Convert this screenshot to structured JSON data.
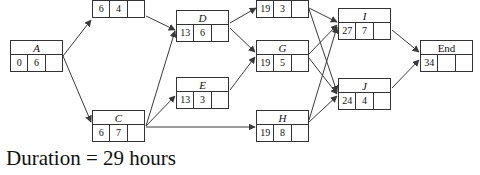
{
  "diagram": {
    "type": "activity-on-node-network",
    "caption": "Duration = 29 hours",
    "edge_color": "#3a3a3a",
    "node_border_color": "#333333",
    "background": "#ffffff",
    "nodes": [
      {
        "id": "A",
        "label": "A",
        "cells": [
          "0",
          "6",
          ""
        ],
        "x": 10,
        "y": 40,
        "w": 53,
        "h": 32,
        "clipped": false
      },
      {
        "id": "B",
        "label": "",
        "cells": [
          "6",
          "4",
          ""
        ],
        "x": 92,
        "y": -14,
        "w": 53,
        "h": 32,
        "clipped": true
      },
      {
        "id": "C",
        "label": "C",
        "cells": [
          "6",
          "7",
          ""
        ],
        "x": 92,
        "y": 110,
        "w": 53,
        "h": 32,
        "clipped": false
      },
      {
        "id": "D",
        "label": "D",
        "cells": [
          "13",
          "6",
          ""
        ],
        "x": 176,
        "y": 10,
        "w": 53,
        "h": 32,
        "clipped": false
      },
      {
        "id": "E",
        "label": "E",
        "cells": [
          "13",
          "3",
          ""
        ],
        "x": 176,
        "y": 77,
        "w": 53,
        "h": 32,
        "clipped": false
      },
      {
        "id": "F",
        "label": "",
        "cells": [
          "19",
          "3",
          ""
        ],
        "x": 256,
        "y": -14,
        "w": 53,
        "h": 32,
        "clipped": true
      },
      {
        "id": "G",
        "label": "G",
        "cells": [
          "19",
          "5",
          ""
        ],
        "x": 256,
        "y": 40,
        "w": 53,
        "h": 32,
        "clipped": false
      },
      {
        "id": "H",
        "label": "H",
        "cells": [
          "19",
          "8",
          ""
        ],
        "x": 256,
        "y": 110,
        "w": 53,
        "h": 32,
        "clipped": false
      },
      {
        "id": "I",
        "label": "I",
        "cells": [
          "27",
          "7",
          ""
        ],
        "x": 338,
        "y": 8,
        "w": 53,
        "h": 32,
        "clipped": false
      },
      {
        "id": "J",
        "label": "J",
        "cells": [
          "24",
          "4",
          ""
        ],
        "x": 338,
        "y": 78,
        "w": 53,
        "h": 32,
        "clipped": false
      },
      {
        "id": "End",
        "label": "End",
        "cells": [
          "34",
          "",
          ""
        ],
        "x": 420,
        "y": 40,
        "w": 53,
        "h": 32,
        "clipped": false,
        "plain": true
      }
    ],
    "edges": [
      {
        "from": "A",
        "to": "B",
        "x1": 63,
        "y1": 56,
        "x2": 91,
        "y2": 20
      },
      {
        "from": "A",
        "to": "C",
        "x1": 63,
        "y1": 56,
        "x2": 91,
        "y2": 122
      },
      {
        "from": "B",
        "to": "D",
        "x1": 146,
        "y1": 16,
        "x2": 175,
        "y2": 30
      },
      {
        "from": "C",
        "to": "D",
        "x1": 146,
        "y1": 126,
        "x2": 175,
        "y2": 31
      },
      {
        "from": "C",
        "to": "E",
        "x1": 146,
        "y1": 126,
        "x2": 175,
        "y2": 96
      },
      {
        "from": "C",
        "to": "H",
        "x1": 146,
        "y1": 127,
        "x2": 255,
        "y2": 127
      },
      {
        "from": "D",
        "to": "F",
        "x1": 230,
        "y1": 23,
        "x2": 256,
        "y2": 8
      },
      {
        "from": "D",
        "to": "G",
        "x1": 230,
        "y1": 28,
        "x2": 255,
        "y2": 52
      },
      {
        "from": "E",
        "to": "G",
        "x1": 230,
        "y1": 90,
        "x2": 255,
        "y2": 57
      },
      {
        "from": "F",
        "to": "I",
        "x1": 309,
        "y1": 8,
        "x2": 337,
        "y2": 22
      },
      {
        "from": "F",
        "to": "J",
        "x1": 309,
        "y1": 9,
        "x2": 337,
        "y2": 92
      },
      {
        "from": "G",
        "to": "I",
        "x1": 309,
        "y1": 54,
        "x2": 337,
        "y2": 25
      },
      {
        "from": "G",
        "to": "J",
        "x1": 309,
        "y1": 58,
        "x2": 337,
        "y2": 94
      },
      {
        "from": "H",
        "to": "I",
        "x1": 309,
        "y1": 120,
        "x2": 337,
        "y2": 27
      },
      {
        "from": "H",
        "to": "J",
        "x1": 309,
        "y1": 122,
        "x2": 337,
        "y2": 96
      },
      {
        "from": "I",
        "to": "End",
        "x1": 392,
        "y1": 30,
        "x2": 419,
        "y2": 52
      },
      {
        "from": "J",
        "to": "End",
        "x1": 392,
        "y1": 88,
        "x2": 419,
        "y2": 60
      }
    ]
  }
}
